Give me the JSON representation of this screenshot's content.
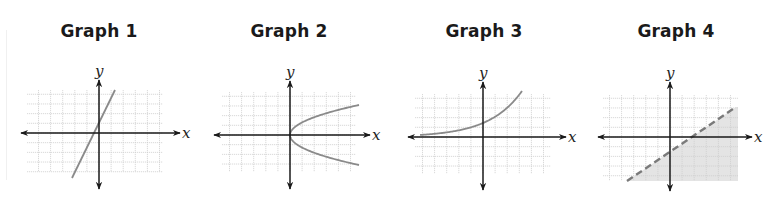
{
  "figure": {
    "panels": [
      {
        "title": "Graph 1",
        "title_x": 99,
        "axis_labels": {
          "x": "x",
          "y": "y"
        },
        "origin": [
          99,
          133
        ],
        "grid": {
          "x0": 27,
          "x1": 163,
          "y0": 90,
          "y1": 172,
          "step": 12.1
        },
        "axis_extent": {
          "left": 21,
          "right": 180,
          "top": 80,
          "bottom": 189
        },
        "curve": {
          "type": "line",
          "style": "solid",
          "points": [
            [
              72,
              178
            ],
            [
              115,
              90
            ]
          ]
        },
        "shading": null,
        "description": "Straight line with positive slope, y-intercept slightly above origin"
      },
      {
        "title": "Graph 2",
        "title_x": 289,
        "axis_labels": {
          "x": "x",
          "y": "y"
        },
        "origin": [
          290,
          135
        ],
        "grid": {
          "x0": 222,
          "x1": 356,
          "y0": 92,
          "y1": 172,
          "step": 12.1
        },
        "axis_extent": {
          "left": 214,
          "right": 370,
          "top": 81,
          "bottom": 189
        },
        "curve": {
          "type": "sideways-parabola",
          "style": "solid",
          "vertex": [
            290,
            135
          ],
          "end_x": 359,
          "end_dy": 30
        },
        "shading": null,
        "description": "Sideways parabola opening to the right with vertex at origin"
      },
      {
        "title": "Graph 3",
        "title_x": 484,
        "axis_labels": {
          "x": "x",
          "y": "y"
        },
        "origin": [
          483,
          137
        ],
        "grid": {
          "x0": 415,
          "x1": 551,
          "y0": 94,
          "y1": 174,
          "step": 12.1
        },
        "axis_extent": {
          "left": 408,
          "right": 566,
          "top": 82,
          "bottom": 190
        },
        "curve": {
          "type": "exponential",
          "style": "solid",
          "x_start": 420,
          "x_end": 522,
          "y_at_axis": 123
        },
        "shading": null,
        "description": "Exponential growth curve, asymptotic to x-axis on the left"
      },
      {
        "title": "Graph 4",
        "title_x": 676,
        "axis_labels": {
          "x": "x",
          "y": "y"
        },
        "origin": [
          670,
          137
        ],
        "grid": {
          "x0": 603,
          "x1": 738,
          "y0": 95,
          "y1": 181,
          "step": 12.1
        },
        "axis_extent": {
          "left": 598,
          "right": 752,
          "top": 82,
          "bottom": 191
        },
        "curve": {
          "type": "line",
          "style": "dashed",
          "points": [
            [
              627,
              181
            ],
            [
              736,
              107
            ]
          ]
        },
        "shading": {
          "side": "below-right",
          "color": "#e4e4e4"
        },
        "description": "Linear inequality with dashed boundary line, region below shaded"
      }
    ],
    "colors": {
      "axis": "#1a1a1a",
      "grid": "#cfcfcf",
      "curve": "#8a8a8a",
      "shade": "#e4e4e4",
      "title": "#1a1a1a"
    }
  }
}
